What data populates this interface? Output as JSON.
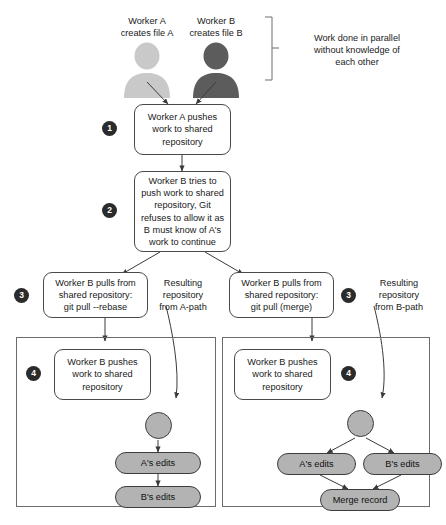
{
  "diagram": {
    "colors": {
      "avatar_a": "#c9c9c9",
      "avatar_b": "#5c5c5c",
      "node_fill": "#b3b3b3",
      "stroke": "#4a4a4a",
      "badge_fill": "#2b2b2b"
    },
    "workers": [
      {
        "name": "worker-a",
        "label": "Worker A\ncreates file A",
        "line1": "Worker A",
        "line2": "creates file A"
      },
      {
        "name": "worker-b",
        "label": "Worker B\ncreates file B",
        "line1": "Worker B",
        "line2": "creates file B"
      }
    ],
    "bracket_note": {
      "line1": "Work done in parallel",
      "line2": "without knowledge of",
      "line3": "each other"
    },
    "steps": [
      {
        "number": "1",
        "text_lines": [
          "Worker A pushes",
          "work to shared",
          "repository"
        ]
      },
      {
        "number": "2",
        "text_lines": [
          "Worker B tries to",
          "push work to shared",
          "repository, Git",
          "refuses to allow it as",
          "B must know of A's",
          "work to continue"
        ]
      },
      {
        "number": "3",
        "text_lines": [
          "Worker B pulls from",
          "shared repository:",
          "git pull --rebase"
        ]
      },
      {
        "number": "3",
        "text_lines": [
          "Worker B pulls from",
          "shared repository:",
          "git pull (merge)"
        ]
      },
      {
        "number": "4",
        "text_lines": [
          "Worker B pushes",
          "work to shared",
          "repository"
        ]
      },
      {
        "number": "4",
        "text_lines": [
          "Worker B pushes",
          "work to shared",
          "repository"
        ]
      }
    ],
    "box_step1": "Worker A pushes work to shared repository",
    "box_step2": "Worker B tries to push work to shared repository, Git refuses to allow it as B must know of A's work to continue",
    "box_step3_left": "Worker B pulls from shared repository: git pull --rebase",
    "box_step3_right": "Worker B pulls from shared repository: git pull (merge)",
    "box_step4_left": "Worker B pushes work to shared repository",
    "box_step4_right": "Worker B pushes work to shared repository",
    "resulting_left": {
      "line1": "Resulting",
      "line2": "repository",
      "line3": "from A-path"
    },
    "resulting_right": {
      "line1": "Resulting",
      "line2": "repository",
      "line3": "from B-path"
    },
    "left_panel_nodes": [
      {
        "name": "commit-root-left",
        "label": ""
      },
      {
        "name": "commit-a-edits-left",
        "label": "A's edits"
      },
      {
        "name": "commit-b-edits-left",
        "label": "B's edits"
      }
    ],
    "right_panel_nodes": [
      {
        "name": "commit-root-right",
        "label": ""
      },
      {
        "name": "commit-a-edits-right",
        "label": "A's edits"
      },
      {
        "name": "commit-b-edits-right",
        "label": "B's edits"
      },
      {
        "name": "commit-merge-record",
        "label": "Merge record"
      }
    ],
    "badges": {
      "one": "1",
      "two": "2",
      "three_left": "3",
      "three_right": "3",
      "four_left": "4",
      "four_right": "4"
    }
  }
}
